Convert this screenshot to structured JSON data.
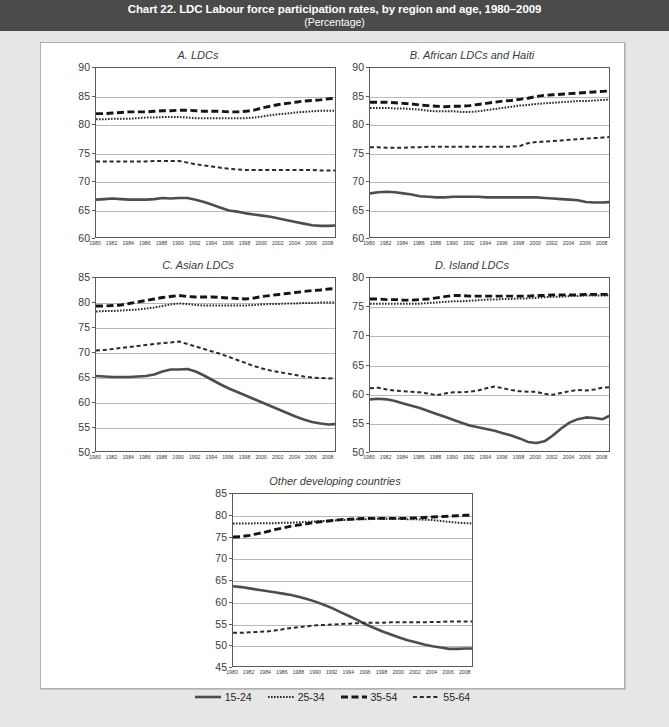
{
  "header": {
    "title": "Chart 22. LDC Labour force participation rates, by region and age, 1980–2009",
    "subtitle": "(Percentage)"
  },
  "legend": {
    "items": [
      {
        "label": "15-24",
        "style": "solid",
        "color": "#4d4d4d",
        "width": 2.6
      },
      {
        "label": "25-34",
        "style": "dotted",
        "color": "#2b2b2b",
        "width": 2.0
      },
      {
        "label": "35-54",
        "style": "dashed",
        "color": "#1a1a1a",
        "width": 2.8
      },
      {
        "label": "55-64",
        "style": "dash-sm",
        "color": "#2b2b2b",
        "width": 2.0
      }
    ]
  },
  "x_labels": [
    "1980",
    "1982",
    "1984",
    "1986",
    "1988",
    "1990",
    "1992",
    "1994",
    "1996",
    "1998",
    "2000",
    "2002",
    "2004",
    "2006",
    "2008"
  ],
  "chart_data": {
    "type": "line",
    "title": "Chart 22. LDC Labour force participation rates, by region and age, 1980–2009",
    "subtitle": "(Percentage)",
    "xlabel": "",
    "ylabel": "Percentage",
    "grid": true,
    "legend_position": "bottom",
    "x": [
      1980,
      1981,
      1982,
      1983,
      1984,
      1985,
      1986,
      1987,
      1988,
      1989,
      1990,
      1991,
      1992,
      1993,
      1994,
      1995,
      1996,
      1997,
      1998,
      1999,
      2000,
      2001,
      2002,
      2003,
      2004,
      2005,
      2006,
      2007,
      2008,
      2009
    ],
    "xlim": [
      1980,
      2009
    ],
    "x_tick_labels": [
      "1980",
      "1982",
      "1984",
      "1986",
      "1988",
      "1990",
      "1992",
      "1994",
      "1996",
      "1998",
      "2000",
      "2002",
      "2004",
      "2006",
      "2008"
    ],
    "panels": [
      {
        "id": "A",
        "title": "A. LDCs",
        "ylim": [
          60,
          90
        ],
        "yticks": [
          60,
          65,
          70,
          75,
          80,
          85,
          90
        ],
        "series": [
          {
            "name": "15-24",
            "style": "solid",
            "values": [
              66.9,
              67.0,
              67.1,
              67.0,
              66.9,
              66.9,
              66.9,
              67.0,
              67.2,
              67.1,
              67.2,
              67.2,
              66.9,
              66.5,
              66.0,
              65.5,
              65.0,
              64.8,
              64.5,
              64.3,
              64.1,
              63.9,
              63.6,
              63.3,
              63.0,
              62.7,
              62.4,
              62.3,
              62.3,
              62.4
            ]
          },
          {
            "name": "25-34",
            "style": "dotted",
            "values": [
              81.0,
              81.0,
              81.1,
              81.1,
              81.1,
              81.2,
              81.3,
              81.3,
              81.4,
              81.4,
              81.4,
              81.3,
              81.2,
              81.2,
              81.2,
              81.2,
              81.2,
              81.2,
              81.2,
              81.3,
              81.5,
              81.7,
              81.9,
              82.0,
              82.2,
              82.3,
              82.4,
              82.5,
              82.5,
              82.5
            ]
          },
          {
            "name": "35-54",
            "style": "dashed",
            "values": [
              82.0,
              82.0,
              82.1,
              82.2,
              82.3,
              82.3,
              82.3,
              82.4,
              82.5,
              82.5,
              82.6,
              82.6,
              82.5,
              82.4,
              82.4,
              82.4,
              82.3,
              82.3,
              82.4,
              82.6,
              83.0,
              83.3,
              83.6,
              83.8,
              84.0,
              84.2,
              84.3,
              84.4,
              84.6,
              84.7
            ]
          },
          {
            "name": "55-64",
            "style": "dash-sm",
            "values": [
              73.6,
              73.6,
              73.6,
              73.6,
              73.6,
              73.6,
              73.6,
              73.7,
              73.7,
              73.7,
              73.7,
              73.4,
              73.1,
              72.9,
              72.7,
              72.5,
              72.3,
              72.2,
              72.1,
              72.1,
              72.1,
              72.1,
              72.1,
              72.1,
              72.1,
              72.1,
              72.1,
              72.0,
              72.0,
              72.0
            ]
          }
        ]
      },
      {
        "id": "B",
        "title": "B. African LDCs and Haiti",
        "ylim": [
          60,
          90
        ],
        "yticks": [
          60,
          65,
          70,
          75,
          80,
          85,
          90
        ],
        "series": [
          {
            "name": "15-24",
            "style": "solid",
            "values": [
              68.0,
              68.2,
              68.3,
              68.2,
              68.0,
              67.8,
              67.5,
              67.4,
              67.3,
              67.3,
              67.4,
              67.4,
              67.4,
              67.4,
              67.3,
              67.3,
              67.3,
              67.3,
              67.3,
              67.3,
              67.3,
              67.2,
              67.1,
              67.0,
              66.9,
              66.8,
              66.5,
              66.4,
              66.4,
              66.5
            ]
          },
          {
            "name": "25-34",
            "style": "dotted",
            "values": [
              83.0,
              83.0,
              83.0,
              82.9,
              82.9,
              82.8,
              82.7,
              82.5,
              82.4,
              82.4,
              82.4,
              82.3,
              82.3,
              82.4,
              82.6,
              82.8,
              83.0,
              83.2,
              83.4,
              83.5,
              83.7,
              83.8,
              83.9,
              84.0,
              84.1,
              84.2,
              84.2,
              84.3,
              84.4,
              84.5
            ]
          },
          {
            "name": "35-54",
            "style": "dashed",
            "values": [
              84.0,
              84.0,
              84.0,
              83.9,
              83.8,
              83.7,
              83.5,
              83.4,
              83.3,
              83.2,
              83.3,
              83.3,
              83.4,
              83.6,
              83.8,
              84.0,
              84.2,
              84.3,
              84.5,
              84.7,
              85.0,
              85.2,
              85.3,
              85.4,
              85.5,
              85.6,
              85.7,
              85.8,
              85.9,
              86.0
            ]
          },
          {
            "name": "55-64",
            "style": "dash-sm",
            "values": [
              76.1,
              76.1,
              76.0,
              76.0,
              76.0,
              76.1,
              76.1,
              76.2,
              76.2,
              76.2,
              76.2,
              76.2,
              76.2,
              76.2,
              76.2,
              76.2,
              76.2,
              76.2,
              76.3,
              76.8,
              77.0,
              77.1,
              77.2,
              77.3,
              77.4,
              77.5,
              77.6,
              77.7,
              77.8,
              77.9
            ]
          }
        ]
      },
      {
        "id": "C",
        "title": "C. Asian LDCs",
        "ylim": [
          50,
          85
        ],
        "yticks": [
          50,
          55,
          60,
          65,
          70,
          75,
          80,
          85
        ],
        "series": [
          {
            "name": "15-24",
            "style": "solid",
            "values": [
              65.4,
              65.3,
              65.2,
              65.2,
              65.2,
              65.3,
              65.4,
              65.7,
              66.3,
              66.7,
              66.7,
              66.8,
              66.3,
              65.5,
              64.6,
              63.7,
              62.9,
              62.2,
              61.5,
              60.8,
              60.1,
              59.4,
              58.7,
              58.0,
              57.3,
              56.7,
              56.2,
              55.9,
              55.7,
              55.8
            ]
          },
          {
            "name": "25-34",
            "style": "dotted",
            "values": [
              78.3,
              78.4,
              78.4,
              78.5,
              78.6,
              78.7,
              78.9,
              79.1,
              79.4,
              79.7,
              79.9,
              79.8,
              79.6,
              79.5,
              79.5,
              79.5,
              79.5,
              79.5,
              79.5,
              79.6,
              79.7,
              79.8,
              79.8,
              79.9,
              79.9,
              80.0,
              80.0,
              80.1,
              80.1,
              80.1
            ]
          },
          {
            "name": "35-54",
            "style": "dashed",
            "values": [
              79.4,
              79.4,
              79.5,
              79.6,
              79.9,
              80.2,
              80.5,
              80.8,
              81.1,
              81.3,
              81.5,
              81.3,
              81.2,
              81.2,
              81.2,
              81.1,
              81.0,
              80.9,
              80.8,
              81.0,
              81.3,
              81.5,
              81.7,
              81.9,
              82.1,
              82.3,
              82.5,
              82.6,
              82.8,
              82.9
            ]
          },
          {
            "name": "55-64",
            "style": "dash-sm",
            "values": [
              70.5,
              70.6,
              70.8,
              71.0,
              71.2,
              71.4,
              71.6,
              71.8,
              72.0,
              72.1,
              72.3,
              71.8,
              71.3,
              70.8,
              70.3,
              69.8,
              69.2,
              68.6,
              68.0,
              67.4,
              66.9,
              66.5,
              66.2,
              65.9,
              65.6,
              65.3,
              65.1,
              65.0,
              64.9,
              65.0
            ]
          }
        ]
      },
      {
        "id": "D",
        "title": "D. Island LDCs",
        "ylim": [
          50,
          80
        ],
        "yticks": [
          50,
          55,
          60,
          65,
          70,
          75,
          80
        ],
        "series": [
          {
            "name": "15-24",
            "style": "solid",
            "values": [
              59.2,
              59.3,
              59.2,
              58.9,
              58.5,
              58.1,
              57.7,
              57.2,
              56.7,
              56.2,
              55.7,
              55.2,
              54.7,
              54.4,
              54.1,
              53.8,
              53.4,
              53.0,
              52.5,
              51.9,
              51.7,
              52.0,
              53.0,
              54.2,
              55.2,
              55.8,
              56.1,
              56.0,
              55.8,
              56.5
            ]
          },
          {
            "name": "25-34",
            "style": "dotted",
            "values": [
              75.6,
              75.6,
              75.6,
              75.6,
              75.6,
              75.6,
              75.6,
              75.7,
              75.8,
              75.9,
              76.0,
              76.0,
              76.1,
              76.2,
              76.3,
              76.3,
              76.4,
              76.4,
              76.5,
              76.5,
              76.6,
              76.7,
              76.8,
              76.8,
              76.9,
              76.9,
              77.0,
              77.0,
              77.0,
              77.0
            ]
          },
          {
            "name": "35-54",
            "style": "dashed",
            "values": [
              76.4,
              76.4,
              76.3,
              76.3,
              76.2,
              76.2,
              76.3,
              76.4,
              76.6,
              76.8,
              77.0,
              77.0,
              76.9,
              76.9,
              76.9,
              76.9,
              76.9,
              76.9,
              76.9,
              76.9,
              77.0,
              77.0,
              77.1,
              77.1,
              77.1,
              77.1,
              77.2,
              77.2,
              77.2,
              77.2
            ]
          },
          {
            "name": "55-64",
            "style": "dash-sm",
            "values": [
              61.1,
              61.2,
              60.9,
              60.7,
              60.6,
              60.5,
              60.4,
              60.2,
              59.9,
              60.2,
              60.4,
              60.4,
              60.5,
              60.7,
              61.1,
              61.4,
              61.1,
              60.8,
              60.6,
              60.5,
              60.5,
              60.1,
              60.0,
              60.3,
              60.6,
              60.8,
              60.7,
              60.9,
              61.2,
              61.3
            ]
          }
        ]
      },
      {
        "id": "E",
        "title": "Other developing countries",
        "ylim": [
          45,
          85
        ],
        "yticks": [
          45,
          50,
          55,
          60,
          65,
          70,
          75,
          80,
          85
        ],
        "series": [
          {
            "name": "15-24",
            "style": "solid",
            "values": [
              63.8,
              63.6,
              63.3,
              63.0,
              62.7,
              62.4,
              62.1,
              61.8,
              61.3,
              60.8,
              60.2,
              59.5,
              58.7,
              57.8,
              56.9,
              56.0,
              55.0,
              54.2,
              53.4,
              52.7,
              52.0,
              51.4,
              50.9,
              50.4,
              50.0,
              49.7,
              49.4,
              49.4,
              49.5,
              49.5
            ]
          },
          {
            "name": "25-34",
            "style": "dotted",
            "values": [
              78.2,
              78.2,
              78.2,
              78.3,
              78.3,
              78.3,
              78.4,
              78.4,
              78.5,
              78.6,
              78.7,
              78.8,
              78.9,
              79.0,
              79.1,
              79.2,
              79.2,
              79.3,
              79.3,
              79.3,
              79.3,
              79.2,
              79.2,
              79.1,
              79.0,
              78.8,
              78.6,
              78.4,
              78.3,
              78.2
            ]
          },
          {
            "name": "35-54",
            "style": "dashed",
            "values": [
              75.1,
              75.2,
              75.5,
              75.9,
              76.3,
              76.8,
              77.2,
              77.6,
              77.9,
              78.2,
              78.5,
              78.7,
              78.9,
              79.1,
              79.2,
              79.3,
              79.4,
              79.4,
              79.4,
              79.4,
              79.4,
              79.4,
              79.5,
              79.6,
              79.7,
              79.8,
              79.9,
              80.0,
              80.1,
              80.1
            ]
          },
          {
            "name": "55-64",
            "style": "dash-sm",
            "values": [
              53.1,
              53.1,
              53.2,
              53.3,
              53.4,
              53.6,
              53.9,
              54.2,
              54.4,
              54.6,
              54.8,
              54.9,
              55.0,
              55.1,
              55.2,
              55.3,
              55.4,
              55.4,
              55.4,
              55.5,
              55.5,
              55.5,
              55.5,
              55.5,
              55.6,
              55.6,
              55.7,
              55.7,
              55.7,
              55.7
            ]
          }
        ]
      }
    ]
  }
}
